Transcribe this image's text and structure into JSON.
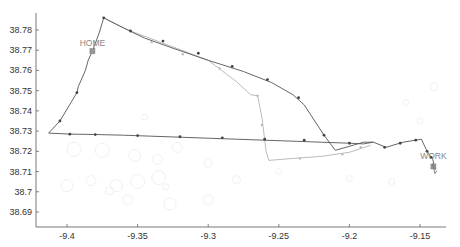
{
  "chart_data": {
    "type": "line",
    "title": "",
    "xlabel": "",
    "ylabel": "",
    "xlim": [
      -9.418,
      -9.13
    ],
    "ylim": [
      38.6855,
      38.7905
    ],
    "grid": false,
    "x_ticks": [
      -9.4,
      -9.35,
      -9.3,
      -9.25,
      -9.2,
      -9.15
    ],
    "x_tick_labels": [
      "-9.4",
      "-9.35",
      "-9.3",
      "-9.25",
      "-9.2",
      "-9.15"
    ],
    "y_ticks": [
      38.69,
      38.7,
      38.71,
      38.72,
      38.73,
      38.74,
      38.75,
      38.76,
      38.77,
      38.78
    ],
    "y_tick_labels": [
      "38.69",
      "38.7",
      "38.71",
      "38.72",
      "38.73",
      "38.74",
      "38.75",
      "38.76",
      "38.77",
      "38.78"
    ],
    "annotations": [
      {
        "text": "HOME",
        "x": -9.382,
        "y": 38.7695
      },
      {
        "text": "WORK",
        "x": -9.1405,
        "y": 38.7135
      }
    ],
    "series": [
      {
        "name": "route-dark",
        "color": "#555555",
        "points": [
          [
            -9.382,
            38.7695
          ],
          [
            -9.385,
            38.765
          ],
          [
            -9.387,
            38.76
          ],
          [
            -9.392,
            38.752
          ],
          [
            -9.393,
            38.749
          ],
          [
            -9.405,
            38.735
          ],
          [
            -9.413,
            38.729
          ],
          [
            -9.398,
            38.7285
          ],
          [
            -9.38,
            38.7283
          ],
          [
            -9.36,
            38.728
          ],
          [
            -9.34,
            38.7275
          ],
          [
            -9.32,
            38.727
          ],
          [
            -9.3,
            38.7265
          ],
          [
            -9.28,
            38.726
          ],
          [
            -9.26,
            38.7255
          ],
          [
            -9.24,
            38.725
          ],
          [
            -9.22,
            38.7245
          ],
          [
            -9.2,
            38.724
          ],
          [
            -9.19,
            38.7237
          ],
          [
            -9.183,
            38.7245
          ],
          [
            -9.174,
            38.722
          ],
          [
            -9.162,
            38.7245
          ],
          [
            -9.149,
            38.726
          ],
          [
            -9.145,
            38.72
          ],
          [
            -9.141,
            38.716
          ],
          [
            -9.139,
            38.711
          ]
        ]
      },
      {
        "name": "route-dark-north",
        "color": "#555555",
        "points": [
          [
            -9.382,
            38.7695
          ],
          [
            -9.377,
            38.779
          ],
          [
            -9.374,
            38.786
          ],
          [
            -9.36,
            38.781
          ],
          [
            -9.345,
            38.776
          ],
          [
            -9.325,
            38.771
          ],
          [
            -9.3,
            38.765
          ],
          [
            -9.275,
            38.7595
          ],
          [
            -9.255,
            38.754
          ],
          [
            -9.24,
            38.748
          ],
          [
            -9.232,
            38.743
          ],
          [
            -9.218,
            38.728
          ],
          [
            -9.21,
            38.7205
          ],
          [
            -9.2,
            38.7225
          ],
          [
            -9.19,
            38.7245
          ],
          [
            -9.183,
            38.7245
          ]
        ]
      },
      {
        "name": "route-light",
        "color": "#aaaaaa",
        "points": [
          [
            -9.374,
            38.786
          ],
          [
            -9.355,
            38.7795
          ],
          [
            -9.33,
            38.773
          ],
          [
            -9.3,
            38.765
          ],
          [
            -9.28,
            38.7545
          ],
          [
            -9.27,
            38.748
          ],
          [
            -9.265,
            38.7475
          ],
          [
            -9.262,
            38.737
          ],
          [
            -9.259,
            38.72
          ],
          [
            -9.257,
            38.7155
          ],
          [
            -9.24,
            38.7165
          ],
          [
            -9.22,
            38.7175
          ],
          [
            -9.2,
            38.7195
          ],
          [
            -9.185,
            38.723
          ]
        ]
      }
    ],
    "markers_dark": [
      [
        -9.393,
        38.749
      ],
      [
        -9.405,
        38.735
      ],
      [
        -9.398,
        38.7285
      ],
      [
        -9.382,
        38.7695
      ],
      [
        -9.374,
        38.786
      ],
      [
        -9.355,
        38.7795
      ],
      [
        -9.332,
        38.7745
      ],
      [
        -9.307,
        38.7685
      ],
      [
        -9.283,
        38.762
      ],
      [
        -9.258,
        38.7555
      ],
      [
        -9.236,
        38.7465
      ],
      [
        -9.218,
        38.728
      ],
      [
        -9.38,
        38.7283
      ],
      [
        -9.35,
        38.7278
      ],
      [
        -9.32,
        38.7272
      ],
      [
        -9.29,
        38.7267
      ],
      [
        -9.26,
        38.726
      ],
      [
        -9.232,
        38.7255
      ],
      [
        -9.2,
        38.724
      ],
      [
        -9.175,
        38.722
      ],
      [
        -9.164,
        38.724
      ],
      [
        -9.153,
        38.7255
      ],
      [
        -9.145,
        38.72
      ],
      [
        -9.142,
        38.717
      ]
    ],
    "markers_light": [
      [
        -9.34,
        38.774
      ],
      [
        -9.318,
        38.768
      ],
      [
        -9.292,
        38.761
      ],
      [
        -9.265,
        38.7475
      ],
      [
        -9.262,
        38.733
      ],
      [
        -9.235,
        38.7165
      ],
      [
        -9.205,
        38.7185
      ],
      [
        -9.192,
        38.722
      ]
    ],
    "markers_square": [
      {
        "x": -9.382,
        "y": 38.7695,
        "label": "HOME"
      },
      {
        "x": -9.1405,
        "y": 38.7125,
        "label": "WORK"
      }
    ],
    "background_circles": [
      [
        -9.395,
        38.721,
        7
      ],
      [
        -9.375,
        38.7205,
        7
      ],
      [
        -9.352,
        38.718,
        6
      ],
      [
        -9.336,
        38.716,
        5
      ],
      [
        -9.322,
        38.722,
        5
      ],
      [
        -9.3,
        38.714,
        4
      ],
      [
        -9.335,
        38.707,
        7
      ],
      [
        -9.35,
        38.705,
        7
      ],
      [
        -9.365,
        38.703,
        6
      ],
      [
        -9.383,
        38.7055,
        5
      ],
      [
        -9.4,
        38.703,
        6
      ],
      [
        -9.327,
        38.694,
        6
      ],
      [
        -9.3,
        38.696,
        5
      ],
      [
        -9.357,
        38.696,
        5
      ],
      [
        -9.37,
        38.7005,
        4
      ],
      [
        -9.33,
        38.7025,
        3
      ],
      [
        -9.28,
        38.706,
        4
      ],
      [
        -9.25,
        38.71,
        3
      ],
      [
        -9.14,
        38.752,
        4
      ],
      [
        -9.16,
        38.744,
        3
      ],
      [
        -9.15,
        38.735,
        3
      ],
      [
        -9.17,
        38.705,
        3
      ],
      [
        -9.2,
        38.7065,
        3
      ],
      [
        -9.345,
        38.737,
        3
      ]
    ]
  }
}
